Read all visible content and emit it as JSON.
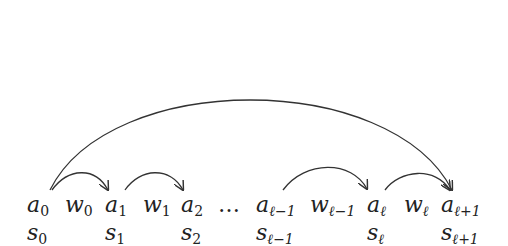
{
  "diagram": {
    "top_row": [
      {
        "id": "a0",
        "base": "a",
        "sub": "0",
        "x": 27
      },
      {
        "id": "w0",
        "base": "w",
        "sub": "0",
        "x": 65
      },
      {
        "id": "a1",
        "base": "a",
        "sub": "1",
        "x": 105
      },
      {
        "id": "w1",
        "base": "w",
        "sub": "1",
        "x": 143
      },
      {
        "id": "a2",
        "base": "a",
        "sub": "2",
        "x": 181
      },
      {
        "id": "al-1",
        "base": "a",
        "sub": "ℓ−1",
        "x": 256
      },
      {
        "id": "wl-1",
        "base": "w",
        "sub": "ℓ−1",
        "x": 310
      },
      {
        "id": "al",
        "base": "a",
        "sub": "ℓ",
        "x": 367
      },
      {
        "id": "wl",
        "base": "w",
        "sub": "ℓ",
        "x": 404
      },
      {
        "id": "al+1",
        "base": "a",
        "sub": "ℓ+1",
        "x": 441
      }
    ],
    "ellipsis": "…",
    "bottom_row": [
      {
        "id": "s0",
        "base": "s",
        "sub": "0",
        "x": 27
      },
      {
        "id": "s1",
        "base": "s",
        "sub": "1",
        "x": 105
      },
      {
        "id": "s2",
        "base": "s",
        "sub": "2",
        "x": 181
      },
      {
        "id": "sl-1",
        "base": "s",
        "sub": "ℓ−1",
        "x": 256
      },
      {
        "id": "sl",
        "base": "s",
        "sub": "ℓ",
        "x": 367
      },
      {
        "id": "sl+1",
        "base": "s",
        "sub": "ℓ+1",
        "x": 441
      }
    ],
    "arrows": [
      {
        "from": "a0",
        "to": "a1"
      },
      {
        "from": "a1",
        "to": "a2"
      },
      {
        "from": "al-1",
        "to": "al"
      },
      {
        "from": "al",
        "to": "al+1"
      },
      {
        "from": "a0",
        "to": "al+1",
        "type": "long-arc"
      }
    ],
    "colors": {
      "ink": "#222222",
      "background": "#ffffff"
    }
  },
  "labels": {
    "a0": {
      "base": "a",
      "sub": "0"
    },
    "w0": {
      "base": "w",
      "sub": "0"
    },
    "a1": {
      "base": "a",
      "sub": "1"
    },
    "w1": {
      "base": "w",
      "sub": "1"
    },
    "a2": {
      "base": "a",
      "sub": "2"
    },
    "dots": "…",
    "al_1": {
      "base": "a",
      "sub": "ℓ−1"
    },
    "wl_1": {
      "base": "w",
      "sub": "ℓ−1"
    },
    "al": {
      "base": "a",
      "sub": "ℓ"
    },
    "wl": {
      "base": "w",
      "sub": "ℓ"
    },
    "al1": {
      "base": "a",
      "sub": "ℓ+1"
    },
    "s0": {
      "base": "s",
      "sub": "0"
    },
    "s1": {
      "base": "s",
      "sub": "1"
    },
    "s2": {
      "base": "s",
      "sub": "2"
    },
    "sl_1": {
      "base": "s",
      "sub": "ℓ−1"
    },
    "sl": {
      "base": "s",
      "sub": "ℓ"
    },
    "sl1": {
      "base": "s",
      "sub": "ℓ+1"
    }
  }
}
